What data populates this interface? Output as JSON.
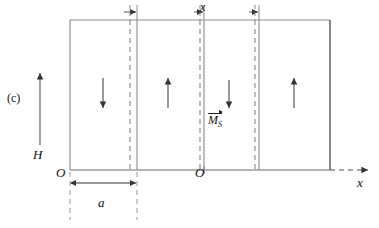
{
  "figure": {
    "panel_label": "(c)",
    "caption_labels": {
      "field": "H",
      "origin_left": "O",
      "origin_mid": "O",
      "axis_x": "x",
      "domain_width": "a",
      "wall_shift": "x",
      "magnetization": "M",
      "magnetization_sub": "S"
    },
    "colors": {
      "stroke": "#555555",
      "stroke_dark": "#222222",
      "dashed": "#777777",
      "background": "#ffffff"
    },
    "geometry": {
      "rect_left": 70,
      "rect_right": 330,
      "rect_top": 20,
      "rect_bottom": 170,
      "walls": [
        {
          "dashed_x": 130,
          "solid_x": 137
        },
        {
          "dashed_x": 200,
          "solid_x": 204
        },
        {
          "dashed_x": 255,
          "solid_x": 259
        }
      ]
    },
    "domains": [
      {
        "index": 1,
        "direction": "down",
        "arrow_x": 103
      },
      {
        "index": 2,
        "direction": "up",
        "arrow_x": 168
      },
      {
        "index": 3,
        "direction": "down",
        "arrow_x": 229
      },
      {
        "index": 4,
        "direction": "up",
        "arrow_x": 294
      }
    ],
    "dimensions": [
      {
        "name": "a",
        "from_x": 70,
        "to_x": 137,
        "y": 183,
        "label": "a"
      },
      {
        "name": "x",
        "position": "top",
        "label": "x"
      }
    ]
  }
}
